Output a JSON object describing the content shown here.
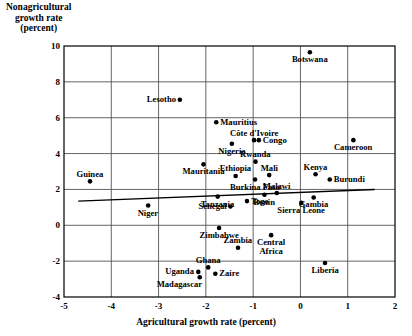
{
  "chart_data": {
    "type": "scatter",
    "title": "",
    "ylabel": "Nonagricultural growth rate (percent)",
    "ylabel_lines": [
      "Nonagricultural",
      "growth rate",
      "(percent)"
    ],
    "xlabel": "Agricultural growth rate (percent)",
    "xlim": [
      -5,
      2
    ],
    "ylim": [
      -4,
      10
    ],
    "xticks": [
      -5,
      -4,
      -3,
      -2,
      -1,
      0,
      1,
      2
    ],
    "xtick_labels": [
      "-5",
      "-4",
      "-3",
      "-2",
      "-1",
      "0",
      "1",
      "2"
    ],
    "yticks": [
      -4,
      -2,
      0,
      2,
      4,
      6,
      8,
      10
    ],
    "ytick_labels": [
      "-4",
      "-2",
      "0",
      "2",
      "4",
      "6",
      "8",
      "10"
    ],
    "grid": true,
    "legend": "none",
    "trendline": {
      "label": "regression line",
      "x0": -4.7,
      "y0": 1.35,
      "x1": 1.57,
      "y1": 2.0
    },
    "points": [
      {
        "name": "Botswana",
        "x": 0.2,
        "y": 9.65,
        "label_pos": "below"
      },
      {
        "name": "Lesotho",
        "x": -2.55,
        "y": 7.0,
        "label_pos": "left"
      },
      {
        "name": "Mauritius",
        "x": -1.78,
        "y": 5.75,
        "label_pos": "right"
      },
      {
        "name": "Cameroon",
        "x": 1.12,
        "y": 4.75,
        "label_pos": "below"
      },
      {
        "name": "Côte d'Ivoire",
        "x": -0.98,
        "y": 4.75,
        "label_pos": "above"
      },
      {
        "name": "Congo",
        "x": -0.88,
        "y": 4.75,
        "label_pos": "right"
      },
      {
        "name": "Nigeria",
        "x": -1.45,
        "y": 4.55,
        "label_pos": "below"
      },
      {
        "name": "Rwanda",
        "x": -0.95,
        "y": 3.55,
        "label_pos": "above"
      },
      {
        "name": "Mauritania",
        "x": -2.05,
        "y": 3.4,
        "label_pos": "below"
      },
      {
        "name": "Kenya",
        "x": 0.32,
        "y": 2.85,
        "label_pos": "above"
      },
      {
        "name": "Mali",
        "x": -0.66,
        "y": 2.8,
        "label_pos": "above"
      },
      {
        "name": "Ethiopia",
        "x": -1.37,
        "y": 2.75,
        "label_pos": "above"
      },
      {
        "name": "Burkina Faso",
        "x": -0.96,
        "y": 2.55,
        "label_pos": "below"
      },
      {
        "name": "Guinea",
        "x": -4.45,
        "y": 2.45,
        "label_pos": "above"
      },
      {
        "name": "Burundi",
        "x": 0.62,
        "y": 2.55,
        "label_pos": "right"
      },
      {
        "name": "Benin",
        "x": -0.76,
        "y": 1.7,
        "label_pos": "below"
      },
      {
        "name": "Malawi",
        "x": -0.5,
        "y": 1.8,
        "label_pos": "above"
      },
      {
        "name": "Tanzania",
        "x": -1.75,
        "y": 1.6,
        "label_pos": "below"
      },
      {
        "name": "Gambia",
        "x": 0.28,
        "y": 1.55,
        "label_pos": "below"
      },
      {
        "name": "Togo",
        "x": -1.13,
        "y": 1.35,
        "label_pos": "right"
      },
      {
        "name": "Sierra Leone",
        "x": 0.02,
        "y": 1.25,
        "label_pos": "below"
      },
      {
        "name": "Niger",
        "x": -3.22,
        "y": 1.1,
        "label_pos": "below"
      },
      {
        "name": "Senegal",
        "x": -1.48,
        "y": 1.05,
        "label_pos": "left"
      },
      {
        "name": "Zimbabwe",
        "x": -1.72,
        "y": -0.15,
        "label_pos": "below"
      },
      {
        "name": "Central Africa",
        "x": -0.62,
        "y": -0.55,
        "label_pos": "below"
      },
      {
        "name": "Zambia",
        "x": -1.32,
        "y": -1.25,
        "label_pos": "above"
      },
      {
        "name": "Liberia",
        "x": 0.52,
        "y": -2.1,
        "label_pos": "below"
      },
      {
        "name": "Ghana",
        "x": -1.95,
        "y": -2.35,
        "label_pos": "above"
      },
      {
        "name": "Zaire",
        "x": -1.8,
        "y": -2.7,
        "label_pos": "right"
      },
      {
        "name": "Uganda",
        "x": -2.16,
        "y": -2.6,
        "label_pos": "left"
      },
      {
        "name": "Madagascar",
        "x": -2.13,
        "y": -2.9,
        "label_pos": "below-left"
      }
    ]
  },
  "axis": {
    "x_title": "Agricultural growth rate (percent)",
    "y_title_lines": [
      "Nonagricultural",
      "growth rate",
      "(percent)"
    ]
  },
  "colors": {
    "axis": "#000000",
    "grid": "#555555",
    "point": "#000000",
    "trend": "#000000",
    "background": "#ffffff"
  }
}
